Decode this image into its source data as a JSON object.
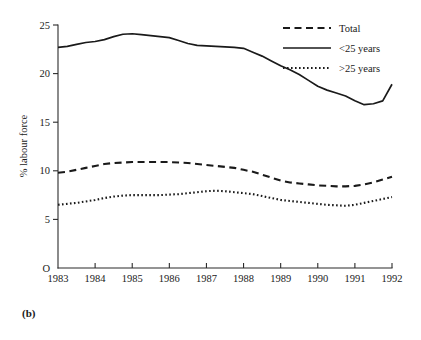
{
  "figure": {
    "panel_label": "(b)",
    "origin_label": "O"
  },
  "chart_data": {
    "type": "line",
    "title": "",
    "xlabel": "",
    "ylabel": "% labour force",
    "x": [
      1983,
      1984,
      1985,
      1986,
      1987,
      1988,
      1989,
      1990,
      1991,
      1992
    ],
    "xticklabels": [
      "1983",
      "1984",
      "1985",
      "1986",
      "1987",
      "1988",
      "1989",
      "1990",
      "1991",
      "1992"
    ],
    "yticks": [
      0,
      5,
      10,
      15,
      20,
      25
    ],
    "yticklabels": [
      "O",
      "5",
      "10",
      "15",
      "20",
      "25"
    ],
    "xlim": [
      1983,
      1992
    ],
    "ylim": [
      0,
      25
    ],
    "grid": false,
    "legend_position": "top-right",
    "series": [
      {
        "name": "Total",
        "style": "dashed",
        "x": [
          1983,
          1983.25,
          1983.5,
          1983.75,
          1984,
          1984.25,
          1984.5,
          1984.75,
          1985,
          1985.25,
          1985.5,
          1985.75,
          1986,
          1986.25,
          1986.5,
          1986.75,
          1987,
          1987.25,
          1987.5,
          1987.75,
          1988,
          1988.25,
          1988.5,
          1988.75,
          1989,
          1989.25,
          1989.5,
          1989.75,
          1990,
          1990.25,
          1990.5,
          1990.75,
          1991,
          1991.25,
          1991.5,
          1991.75,
          1992
        ],
        "values": [
          9.8,
          9.9,
          10.1,
          10.3,
          10.5,
          10.7,
          10.8,
          10.85,
          10.9,
          10.9,
          10.9,
          10.9,
          10.9,
          10.85,
          10.8,
          10.7,
          10.6,
          10.5,
          10.4,
          10.3,
          10.1,
          9.9,
          9.6,
          9.3,
          9.0,
          8.8,
          8.7,
          8.6,
          8.5,
          8.45,
          8.4,
          8.4,
          8.45,
          8.6,
          8.8,
          9.1,
          9.4
        ]
      },
      {
        "name": "<25 years",
        "style": "solid",
        "x": [
          1983,
          1983.25,
          1983.5,
          1983.75,
          1984,
          1984.25,
          1984.5,
          1984.75,
          1985,
          1985.25,
          1985.5,
          1985.75,
          1986,
          1986.25,
          1986.5,
          1986.75,
          1987,
          1987.25,
          1987.5,
          1987.75,
          1988,
          1988.25,
          1988.5,
          1988.75,
          1989,
          1989.25,
          1989.5,
          1989.75,
          1990,
          1990.25,
          1990.5,
          1990.75,
          1991,
          1991.25,
          1991.5,
          1991.75,
          1992
        ],
        "values": [
          22.7,
          22.8,
          23.0,
          23.2,
          23.3,
          23.5,
          23.8,
          24.05,
          24.1,
          24.0,
          23.9,
          23.8,
          23.7,
          23.4,
          23.1,
          22.9,
          22.85,
          22.8,
          22.75,
          22.7,
          22.6,
          22.2,
          21.8,
          21.3,
          20.8,
          20.4,
          19.9,
          19.3,
          18.7,
          18.3,
          18.0,
          17.7,
          17.2,
          16.8,
          16.9,
          17.2,
          18.9
        ]
      },
      {
        "name": ">25 years",
        "style": "dotted",
        "x": [
          1983,
          1983.25,
          1983.5,
          1983.75,
          1984,
          1984.25,
          1984.5,
          1984.75,
          1985,
          1985.25,
          1985.5,
          1985.75,
          1986,
          1986.25,
          1986.5,
          1986.75,
          1987,
          1987.25,
          1987.5,
          1987.75,
          1988,
          1988.25,
          1988.5,
          1988.75,
          1989,
          1989.25,
          1989.5,
          1989.75,
          1990,
          1990.25,
          1990.5,
          1990.75,
          1991,
          1991.25,
          1991.5,
          1991.75,
          1992
        ],
        "values": [
          6.5,
          6.6,
          6.7,
          6.85,
          7.0,
          7.2,
          7.35,
          7.45,
          7.5,
          7.5,
          7.5,
          7.5,
          7.55,
          7.6,
          7.7,
          7.8,
          7.9,
          7.95,
          7.9,
          7.8,
          7.7,
          7.6,
          7.4,
          7.2,
          7.0,
          6.9,
          6.8,
          6.7,
          6.6,
          6.5,
          6.45,
          6.4,
          6.5,
          6.7,
          6.9,
          7.1,
          7.3
        ]
      }
    ],
    "legend": [
      {
        "label": "Total",
        "style": "dashed"
      },
      {
        "label": "<25 years",
        "style": "solid"
      },
      {
        "label": ">25 years",
        "style": "dotted"
      }
    ]
  }
}
